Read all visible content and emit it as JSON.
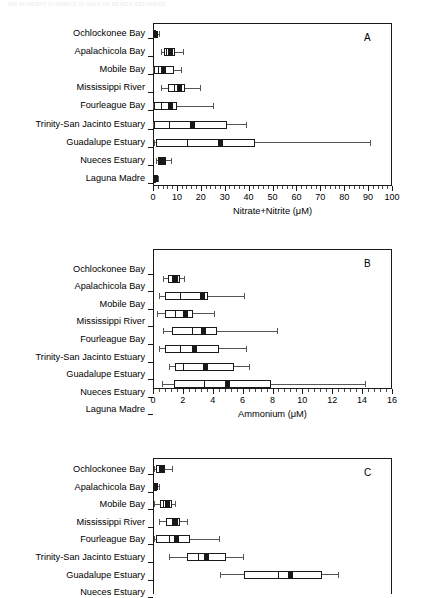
{
  "header": {
    "running_head": "486   NUTRIENT DYNAMICS IN GULF OF MEXICO ESTUARIES"
  },
  "chart_data": [
    {
      "type": "box",
      "panel_letter": "A",
      "title": "",
      "xlabel": "Nitrate+Nitrite  (μM)",
      "ylabel": "",
      "xlim": [
        0,
        100
      ],
      "xticks": [
        0,
        10,
        20,
        30,
        40,
        50,
        60,
        70,
        80,
        90,
        100
      ],
      "xticklabels": [
        "0",
        "10",
        "20",
        "30",
        "40",
        "50",
        "60",
        "70",
        "80",
        "90",
        "100"
      ],
      "minor_tick_step": 2,
      "grid": false,
      "categories": [
        "Ochlockonee Bay",
        "Apalachicola Bay",
        "Mobile Bay",
        "Mississippi River",
        "Fourleague  Bay",
        "Trinity-San Jacinto Estuary",
        "Guadalupe Estuary",
        "Nueces Estuary",
        "Laguna Madre"
      ],
      "boxes": [
        {
          "category": "Ochlockonee Bay",
          "whisker_low": 0.2,
          "q1": 0.4,
          "median": 0.7,
          "mean": 0.9,
          "q3": 1.3,
          "whisker_high": 2.6
        },
        {
          "category": "Apalachicola Bay",
          "whisker_low": 3.3,
          "q1": 4.6,
          "median": 5.3,
          "mean": 7.2,
          "q3": 9.1,
          "whisker_high": 12.6
        },
        {
          "category": "Mobile Bay",
          "whisker_low": 0.2,
          "q1": 0.5,
          "median": 2.0,
          "mean": 4.6,
          "q3": 8.9,
          "whisker_high": 11.7
        },
        {
          "category": "Mississippi River",
          "whisker_low": 3.2,
          "q1": 6.2,
          "median": 8.6,
          "mean": 11.0,
          "q3": 13.2,
          "whisker_high": 19.6
        },
        {
          "category": "Fourleague  Bay",
          "whisker_low": 0.2,
          "q1": 0.5,
          "median": 3.2,
          "mean": 7.2,
          "q3": 9.9,
          "whisker_high": 25.3
        },
        {
          "category": "Trinity-San Jacinto Estuary",
          "whisker_low": 0.2,
          "q1": 0.5,
          "median": 6.8,
          "mean": 16.4,
          "q3": 30.8,
          "whisker_high": 38.8
        },
        {
          "category": "Guadalupe Estuary",
          "whisker_low": 0.3,
          "q1": 1.4,
          "median": 14.3,
          "mean": 28.2,
          "q3": 42.6,
          "whisker_high": 90.6
        },
        {
          "category": "Nueces Estuary",
          "whisker_low": 1.2,
          "q1": 2.0,
          "median": 2.6,
          "mean": 4.0,
          "q3": 5.6,
          "whisker_high": 7.4
        },
        {
          "category": "Laguna Madre",
          "whisker_low": 0.2,
          "q1": 0.4,
          "median": 0.6,
          "mean": 1.0,
          "q3": 1.4,
          "whisker_high": 2.2
        }
      ]
    },
    {
      "type": "box",
      "panel_letter": "B",
      "title": "",
      "xlabel": "Ammonium  (μM)",
      "ylabel": "",
      "xlim": [
        0,
        16
      ],
      "xticks": [
        0,
        2,
        4,
        6,
        8,
        10,
        12,
        14,
        16
      ],
      "xticklabels": [
        "0",
        "2",
        "4",
        "6",
        "8",
        "10",
        "12",
        "14",
        "16"
      ],
      "minor_tick_step": 0.4,
      "grid": false,
      "categories": [
        "Ochlockonee Bay",
        "Apalachicola Bay",
        "Mobile Bay",
        "Mississippi River",
        "Fourleague  Bay",
        "Trinity-San Jacinto Estuary",
        "Guadalupe Estuary",
        "Nueces Estuary",
        "Laguna Madre"
      ],
      "boxes": [
        {
          "category": "Ochlockonee Bay",
          "whisker_low": 0.7,
          "q1": 1.0,
          "median": 1.3,
          "mean": 1.5,
          "q3": 1.8,
          "whisker_high": 2.1
        },
        {
          "category": "Apalachicola Bay",
          "whisker_low": 0.4,
          "q1": 0.8,
          "median": 1.8,
          "mean": 3.3,
          "q3": 3.7,
          "whisker_high": 6.1
        },
        {
          "category": "Mobile Bay",
          "whisker_low": 0.3,
          "q1": 0.8,
          "median": 1.5,
          "mean": 2.2,
          "q3": 2.7,
          "whisker_high": 4.1
        },
        {
          "category": "Mississippi River",
          "whisker_low": 0.7,
          "q1": 1.3,
          "median": 2.6,
          "mean": 3.4,
          "q3": 4.3,
          "whisker_high": 8.3
        },
        {
          "category": "Fourleague  Bay",
          "whisker_low": 0.4,
          "q1": 0.8,
          "median": 1.8,
          "mean": 2.8,
          "q3": 4.4,
          "whisker_high": 6.2
        },
        {
          "category": "Trinity-San Jacinto Estuary",
          "whisker_low": 1.1,
          "q1": 1.5,
          "median": 2.0,
          "mean": 3.5,
          "q3": 5.4,
          "whisker_high": 6.4
        },
        {
          "category": "Guadalupe Estuary",
          "whisker_low": 0.6,
          "q1": 1.4,
          "median": 3.4,
          "mean": 5.0,
          "q3": 7.9,
          "whisker_high": 14.2
        },
        {
          "category": "Nueces Estuary",
          "whisker_low": 1.1,
          "q1": 2.5,
          "median": 4.0,
          "mean": 5.2,
          "q3": 7.3,
          "whisker_high": 9.8
        },
        {
          "category": "Laguna Madre",
          "whisker_low": 1.3,
          "q1": 2.6,
          "median": 4.2,
          "mean": 5.3,
          "q3": 7.2,
          "whisker_high": 9.8
        }
      ]
    },
    {
      "type": "box",
      "panel_letter": "C",
      "title": "",
      "xlabel": "",
      "ylabel": "",
      "xlim": [
        0,
        16
      ],
      "xticks": [],
      "xticklabels": [],
      "minor_tick_step": 0.4,
      "grid": false,
      "cropped": true,
      "categories": [
        "Ochlockonee Bay",
        "Apalachicola Bay",
        "Mobile Bay",
        "Mississippi River",
        "Fourleague  Bay",
        "Trinity-San Jacinto Estuary",
        "Guadalupe Estuary",
        "Nueces Estuary"
      ],
      "boxes": [
        {
          "category": "Ochlockonee Bay",
          "whisker_low": 0.1,
          "q1": 0.2,
          "median": 0.4,
          "mean": 0.55,
          "q3": 0.8,
          "whisker_high": 1.3
        },
        {
          "category": "Apalachicola Bay",
          "whisker_low": 0.05,
          "q1": 0.1,
          "median": 0.15,
          "mean": 0.2,
          "q3": 0.3,
          "whisker_high": 0.4
        },
        {
          "category": "Mobile Bay",
          "whisker_low": 0.1,
          "q1": 0.5,
          "median": 0.7,
          "mean": 1.0,
          "q3": 1.3,
          "whisker_high": 1.5
        },
        {
          "category": "Mississippi River",
          "whisker_low": 0.4,
          "q1": 0.9,
          "median": 1.3,
          "mean": 1.5,
          "q3": 1.8,
          "whisker_high": 2.3
        },
        {
          "category": "Fourleague  Bay",
          "whisker_low": 0.1,
          "q1": 0.2,
          "median": 1.1,
          "mean": 1.6,
          "q3": 2.5,
          "whisker_high": 4.4
        },
        {
          "category": "Trinity-San Jacinto Estuary",
          "whisker_low": 1.1,
          "q1": 2.3,
          "median": 3.0,
          "mean": 3.6,
          "q3": 4.9,
          "whisker_high": 6.0
        },
        {
          "category": "Guadalupe Estuary",
          "whisker_low": 4.5,
          "q1": 6.1,
          "median": 8.4,
          "mean": 9.2,
          "q3": 11.3,
          "whisker_high": 12.4
        },
        {
          "category": "Nueces Estuary",
          "whisker_low": 0.1,
          "q1": 0.8,
          "median": 2.0,
          "mean": 2.2,
          "q3": 3.2,
          "whisker_high": 4.0
        }
      ]
    }
  ]
}
